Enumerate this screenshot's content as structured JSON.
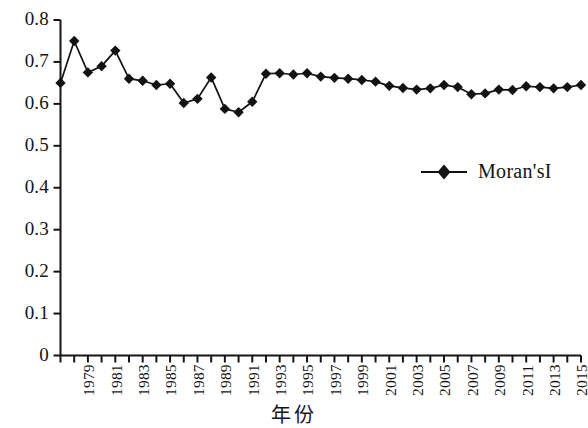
{
  "chart_data": {
    "type": "line",
    "title": "",
    "subtitle": "",
    "xlabel": "年份",
    "ylabel": "",
    "grid": false,
    "legend_position": "inside-right-middle",
    "xlim": [
      1978,
      2016
    ],
    "ylim": [
      0,
      0.8
    ],
    "ytick_labels": [
      "0.8",
      "0.7",
      "0.6",
      "0.5",
      "0.4",
      "0.3",
      "0.2",
      "0.1",
      "0"
    ],
    "ytick_values": [
      0.8,
      0.7,
      0.6,
      0.5,
      0.4,
      0.3,
      0.2,
      0.1,
      0
    ],
    "xtick_labels": [
      "1979",
      "1981",
      "1983",
      "1985",
      "1987",
      "1989",
      "1991",
      "1993",
      "1995",
      "1997",
      "1999",
      "2001",
      "2003",
      "2005",
      "2007",
      "2009",
      "2011",
      "2013",
      "2015"
    ],
    "xtick_values": [
      1979,
      1981,
      1983,
      1985,
      1987,
      1989,
      1991,
      1993,
      1995,
      1997,
      1999,
      2001,
      2003,
      2005,
      2007,
      2009,
      2011,
      2013,
      2015
    ],
    "series": [
      {
        "name": "Moran'sI",
        "marker": "diamond",
        "color": "#121212",
        "x": [
          1978,
          1979,
          1980,
          1981,
          1982,
          1983,
          1984,
          1985,
          1986,
          1987,
          1988,
          1989,
          1990,
          1991,
          1992,
          1993,
          1994,
          1995,
          1996,
          1997,
          1998,
          1999,
          2000,
          2001,
          2002,
          2003,
          2004,
          2005,
          2006,
          2007,
          2008,
          2009,
          2010,
          2011,
          2012,
          2013,
          2014,
          2015,
          2016
        ],
        "values": [
          0.65,
          0.75,
          0.675,
          0.69,
          0.727,
          0.66,
          0.655,
          0.645,
          0.648,
          0.602,
          0.612,
          0.663,
          0.588,
          0.58,
          0.605,
          0.672,
          0.673,
          0.67,
          0.673,
          0.665,
          0.662,
          0.66,
          0.657,
          0.653,
          0.643,
          0.638,
          0.634,
          0.637,
          0.645,
          0.64,
          0.623,
          0.625,
          0.634,
          0.633,
          0.642,
          0.64,
          0.637,
          0.64,
          0.645
        ]
      }
    ]
  },
  "legend": {
    "entries": [
      {
        "label": "Moran'sI",
        "marker": "diamond",
        "color": "#121212"
      }
    ]
  },
  "axes": {
    "x_title": "年份",
    "y_title": ""
  }
}
